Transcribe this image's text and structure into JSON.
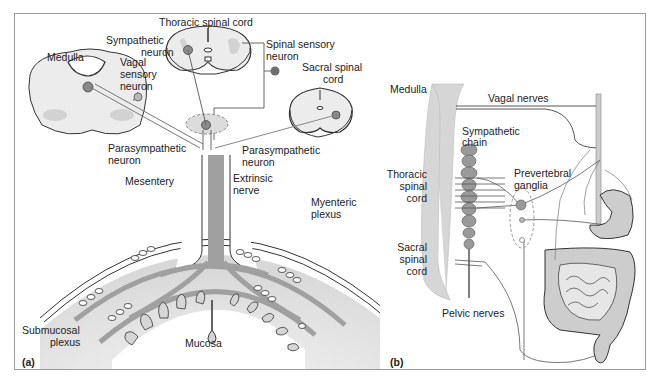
{
  "figure": {
    "panels": [
      {
        "id": "a",
        "tag": "(a)"
      },
      {
        "id": "b",
        "tag": "(b)"
      }
    ],
    "colors": {
      "frame": "#9a9a9a",
      "tissue_light": "#ececec",
      "tissue_mid": "#cfcfcf",
      "nerve_gray": "#9c9c9c",
      "neuron_fill": "#8a8a8a",
      "line": "#333333"
    }
  },
  "panel_a": {
    "labels": {
      "thoracic_spinal_cord": "Thoracic spinal cord",
      "sympathetic_neuron_1": "Sympathetic",
      "sympathetic_neuron_2": "neuron",
      "medulla": "Medulla",
      "vagal_sensory_1": "Vagal",
      "vagal_sensory_2": "sensory",
      "vagal_sensory_3": "neuron",
      "spinal_sensory_1": "Spinal sensory",
      "spinal_sensory_2": "neuron",
      "sacral_spinal_1": "Sacral spinal",
      "sacral_spinal_2": "cord",
      "parasympathetic_left_1": "Parasympathetic",
      "parasympathetic_left_2": "neuron",
      "parasympathetic_right_1": "Parasympathetic",
      "parasympathetic_right_2": "neuron",
      "mesentery": "Mesentery",
      "extrinsic_nerve_1": "Extrinsic",
      "extrinsic_nerve_2": "nerve",
      "myenteric_plexus_1": "Myenteric",
      "myenteric_plexus_2": "plexus",
      "submucosal_plexus_1": "Submucosal",
      "submucosal_plexus_2": "plexus",
      "mucosa": "Mucosa"
    }
  },
  "panel_b": {
    "labels": {
      "medulla": "Medulla",
      "vagal_nerves": "Vagal nerves",
      "sympathetic_chain_1": "Sympathetic",
      "sympathetic_chain_2": "chain",
      "thoracic_1": "Thoracic",
      "thoracic_2": "spinal",
      "thoracic_3": "cord",
      "prevertebral_1": "Prevertebral",
      "prevertebral_2": "ganglia",
      "sacral_1": "Sacral",
      "sacral_2": "spinal",
      "sacral_3": "cord",
      "pelvic_nerves": "Pelvic nerves"
    }
  }
}
